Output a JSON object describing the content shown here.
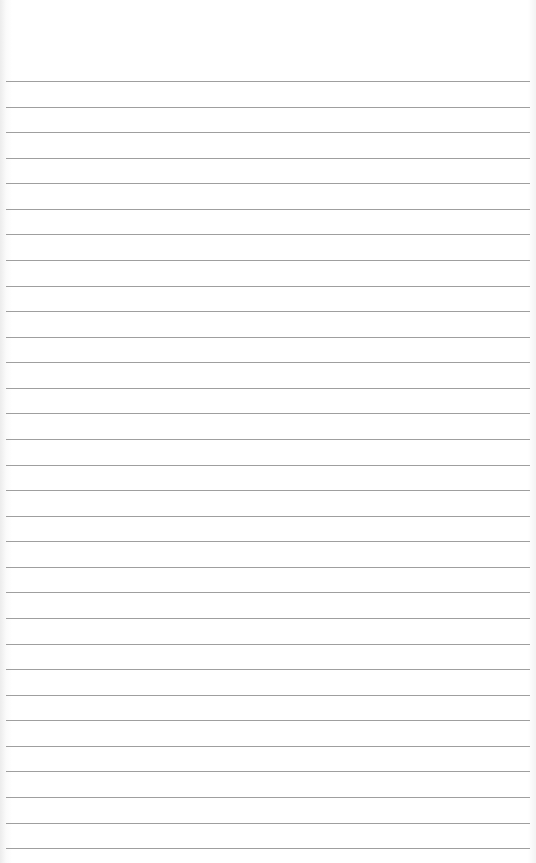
{
  "paper": {
    "type": "lined-paper",
    "background_color": "#ffffff",
    "rule_color": "#8e8e8e",
    "first_rule_y": 81,
    "rule_spacing": 25.57,
    "rule_count": 31
  }
}
